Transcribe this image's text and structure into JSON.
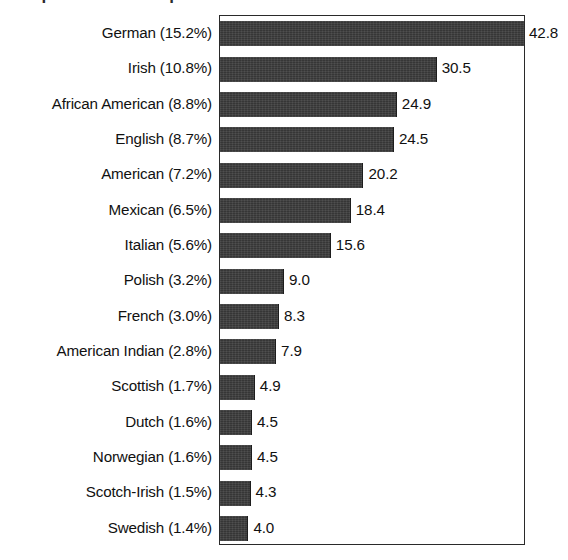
{
  "title_remnant": "Top Ancestries Reported",
  "chart_data": {
    "type": "bar",
    "orientation": "horizontal",
    "title": "",
    "xlabel": "",
    "ylabel": "",
    "grid": false,
    "legend": "none",
    "xlim": [
      0,
      42.8
    ],
    "value_unit": "millions",
    "categories": [
      "German (15.2%)",
      "Irish (10.8%)",
      "African American (8.8%)",
      "English (8.7%)",
      "American (7.2%)",
      "Mexican (6.5%)",
      "Italian (5.6%)",
      "Polish (3.2%)",
      "French (3.0%)",
      "American Indian (2.8%)",
      "Scottish (1.7%)",
      "Dutch (1.6%)",
      "Norwegian (1.6%)",
      "Scotch-Irish (1.5%)",
      "Swedish (1.4%)"
    ],
    "values": [
      42.8,
      30.5,
      24.9,
      24.5,
      20.2,
      18.4,
      15.6,
      9.0,
      8.3,
      7.9,
      4.9,
      4.5,
      4.5,
      4.3,
      4.0
    ],
    "value_labels": [
      "42.8",
      "30.5",
      "24.9",
      "24.5",
      "20.2",
      "18.4",
      "15.6",
      "9.0",
      "8.3",
      "7.9",
      "4.9",
      "4.5",
      "4.5",
      "4.3",
      "4.0"
    ],
    "percent_labels": [
      "15.2%",
      "10.8%",
      "8.8%",
      "8.7%",
      "7.2%",
      "6.5%",
      "5.6%",
      "3.2%",
      "3.0%",
      "2.8%",
      "1.7%",
      "1.6%",
      "1.6%",
      "1.5%",
      "1.4%"
    ],
    "series": [
      {
        "name": "Ancestry population",
        "values": [
          42.8,
          30.5,
          24.9,
          24.5,
          20.2,
          18.4,
          15.6,
          9.0,
          8.3,
          7.9,
          4.9,
          4.5,
          4.5,
          4.3,
          4.0
        ]
      }
    ],
    "colors": {
      "bar_fill": "#3b3b3b",
      "bar_edge": "#1d1d1d",
      "frame": "#2a2a2a",
      "text": "#111111",
      "background": "#ffffff"
    }
  }
}
